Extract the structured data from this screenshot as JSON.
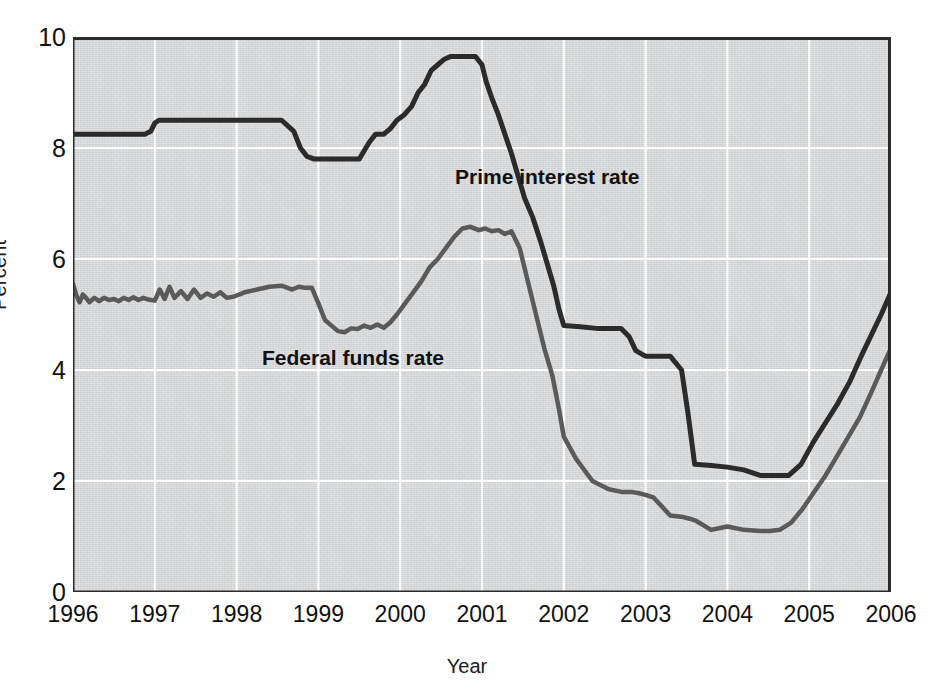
{
  "figure": {
    "background_color": "#ffffff",
    "plot_background_color": "#d9dadb",
    "grid_color": "#ffffff",
    "axis_color": "#2b2b2b"
  },
  "axes": {
    "ylabel": "Percent",
    "xlabel": "Year",
    "yticks": [
      "0",
      "2",
      "4",
      "6",
      "8",
      "10"
    ],
    "xticks": [
      "1996",
      "1997",
      "1998",
      "1999",
      "2000",
      "2001",
      "2002",
      "2003",
      "2004",
      "2005",
      "2006"
    ]
  },
  "legend": {
    "prime": {
      "label": "Prime interest rate",
      "color": "#2b2b2b",
      "x": 455,
      "y": 175
    },
    "fed": {
      "label": "Federal funds rate",
      "color": "#5a5a5a",
      "x": 262,
      "y": 356
    }
  },
  "chart_data": {
    "type": "line",
    "title": "",
    "xlabel": "Year",
    "ylabel": "Percent",
    "xlim": [
      1996,
      2006
    ],
    "ylim": [
      0,
      10
    ],
    "ytick_values": [
      0,
      2,
      4,
      6,
      8,
      10
    ],
    "xtick_values": [
      1996,
      1997,
      1998,
      1999,
      2000,
      2001,
      2002,
      2003,
      2004,
      2005,
      2006
    ],
    "grid": true,
    "grid_color": "#ffffff",
    "legend_position": "inline-annotations",
    "series": [
      {
        "name": "Prime interest rate",
        "color": "#2b2b2b",
        "linewidth": 5,
        "x": [
          1996.0,
          1996.1,
          1996.2,
          1996.3,
          1996.4,
          1996.5,
          1996.6,
          1996.7,
          1996.8,
          1996.88,
          1996.95,
          1997.0,
          1997.05,
          1997.2,
          1997.4,
          1997.6,
          1997.8,
          1998.0,
          1998.2,
          1998.4,
          1998.55,
          1998.7,
          1998.78,
          1998.86,
          1998.95,
          1999.1,
          1999.3,
          1999.5,
          1999.56,
          1999.62,
          1999.7,
          1999.8,
          1999.88,
          1999.96,
          2000.05,
          2000.14,
          2000.22,
          2000.3,
          2000.38,
          2000.46,
          2000.54,
          2000.62,
          2000.72,
          2000.82,
          2000.92,
          2001.0,
          2001.05,
          2001.12,
          2001.2,
          2001.28,
          2001.36,
          2001.44,
          2001.52,
          2001.62,
          2001.72,
          2001.8,
          2001.88,
          2001.94,
          2002.0,
          2002.2,
          2002.4,
          2002.55,
          2002.7,
          2002.8,
          2002.88,
          2002.96,
          2003.0,
          2003.04,
          2003.1,
          2003.3,
          2003.44,
          2003.52,
          2003.6,
          2003.8,
          2004.0,
          2004.2,
          2004.4,
          2004.5,
          2004.6,
          2004.75,
          2004.9,
          2005.05,
          2005.2,
          2005.35,
          2005.5,
          2005.62,
          2005.75,
          2005.88,
          2006.0
        ],
        "y": [
          8.25,
          8.25,
          8.25,
          8.25,
          8.25,
          8.25,
          8.25,
          8.25,
          8.25,
          8.25,
          8.3,
          8.45,
          8.5,
          8.5,
          8.5,
          8.5,
          8.5,
          8.5,
          8.5,
          8.5,
          8.5,
          8.3,
          8.0,
          7.85,
          7.8,
          7.8,
          7.8,
          7.8,
          7.95,
          8.1,
          8.25,
          8.25,
          8.35,
          8.5,
          8.6,
          8.75,
          9.0,
          9.15,
          9.4,
          9.5,
          9.6,
          9.65,
          9.65,
          9.65,
          9.65,
          9.5,
          9.2,
          8.9,
          8.6,
          8.25,
          7.9,
          7.5,
          7.1,
          6.75,
          6.3,
          5.9,
          5.5,
          5.1,
          4.8,
          4.78,
          4.75,
          4.75,
          4.75,
          4.6,
          4.35,
          4.28,
          4.25,
          4.25,
          4.25,
          4.25,
          4.0,
          3.2,
          2.3,
          2.28,
          2.25,
          2.2,
          2.1,
          2.1,
          2.1,
          2.1,
          2.3,
          2.7,
          3.05,
          3.4,
          3.8,
          4.2,
          4.6,
          5.0,
          5.4
        ]
      },
      {
        "name": "Federal funds rate",
        "color": "#5a5a5a",
        "linewidth": 4.5,
        "x": [
          1996.0,
          1996.04,
          1996.08,
          1996.12,
          1996.16,
          1996.2,
          1996.26,
          1996.32,
          1996.38,
          1996.44,
          1996.5,
          1996.56,
          1996.62,
          1996.68,
          1996.74,
          1996.8,
          1996.86,
          1996.92,
          1997.0,
          1997.06,
          1997.12,
          1997.18,
          1997.24,
          1997.32,
          1997.4,
          1997.48,
          1997.56,
          1997.64,
          1997.72,
          1997.8,
          1997.88,
          1997.96,
          1998.1,
          1998.25,
          1998.4,
          1998.55,
          1998.68,
          1998.76,
          1998.84,
          1998.92,
          1999.0,
          1999.08,
          1999.16,
          1999.24,
          1999.32,
          1999.4,
          1999.48,
          1999.56,
          1999.64,
          1999.72,
          1999.8,
          1999.88,
          1999.96,
          2000.06,
          2000.16,
          2000.26,
          2000.36,
          2000.46,
          2000.56,
          2000.66,
          2000.76,
          2000.86,
          2000.96,
          2001.04,
          2001.12,
          2001.2,
          2001.28,
          2001.36,
          2001.46,
          2001.56,
          2001.66,
          2001.76,
          2001.86,
          2001.94,
          2002.0,
          2002.15,
          2002.35,
          2002.55,
          2002.72,
          2002.84,
          2002.92,
          2003.0,
          2003.1,
          2003.3,
          2003.46,
          2003.54,
          2003.62,
          2003.8,
          2004.0,
          2004.2,
          2004.4,
          2004.52,
          2004.64,
          2004.78,
          2004.92,
          2005.06,
          2005.2,
          2005.34,
          2005.48,
          2005.62,
          2005.76,
          2005.88,
          2006.0
        ],
        "y": [
          5.55,
          5.35,
          5.22,
          5.36,
          5.3,
          5.22,
          5.3,
          5.24,
          5.3,
          5.26,
          5.28,
          5.24,
          5.3,
          5.26,
          5.31,
          5.26,
          5.3,
          5.27,
          5.25,
          5.45,
          5.28,
          5.5,
          5.3,
          5.42,
          5.28,
          5.45,
          5.3,
          5.38,
          5.32,
          5.4,
          5.3,
          5.32,
          5.4,
          5.45,
          5.5,
          5.52,
          5.45,
          5.5,
          5.48,
          5.48,
          5.2,
          4.9,
          4.8,
          4.7,
          4.68,
          4.75,
          4.74,
          4.8,
          4.76,
          4.82,
          4.76,
          4.86,
          5.0,
          5.2,
          5.4,
          5.6,
          5.85,
          6.0,
          6.2,
          6.4,
          6.55,
          6.58,
          6.52,
          6.55,
          6.5,
          6.52,
          6.45,
          6.5,
          6.2,
          5.6,
          5.0,
          4.4,
          3.9,
          3.3,
          2.8,
          2.4,
          2.0,
          1.85,
          1.8,
          1.8,
          1.78,
          1.75,
          1.7,
          1.38,
          1.35,
          1.32,
          1.28,
          1.12,
          1.18,
          1.12,
          1.1,
          1.1,
          1.12,
          1.25,
          1.5,
          1.8,
          2.1,
          2.45,
          2.8,
          3.15,
          3.6,
          4.0,
          4.4
        ]
      }
    ]
  }
}
